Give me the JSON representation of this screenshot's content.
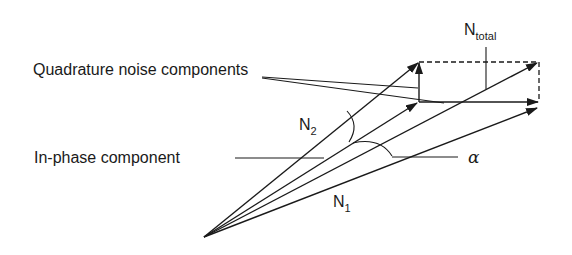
{
  "diagram": {
    "labels": {
      "quadrature": "Quadrature noise components",
      "inphase": "In-phase component",
      "n_total_main": "N",
      "n_total_sub": "total",
      "n1_main": "N",
      "n1_sub": "1",
      "n2_main": "N",
      "n2_sub": "2",
      "alpha": "α"
    },
    "vectors": [
      {
        "name": "N2",
        "from": [
          204,
          237
        ],
        "to": [
          419,
          62
        ]
      },
      {
        "name": "in-phase",
        "from": [
          204,
          237
        ],
        "to": [
          418,
          103
        ]
      },
      {
        "name": "N_total",
        "from": [
          204,
          237
        ],
        "to": [
          538,
          62
        ]
      },
      {
        "name": "N1",
        "from": [
          204,
          237
        ],
        "to": [
          538,
          108
        ]
      },
      {
        "name": "quadrature-vertical",
        "from": [
          419,
          102
        ],
        "to": [
          419,
          62
        ]
      },
      {
        "name": "quadrature-horizontal",
        "from": [
          419,
          102
        ],
        "to": [
          539,
          102
        ]
      }
    ],
    "colors": {
      "stroke": "#1a1a1a",
      "background": "#ffffff"
    }
  }
}
